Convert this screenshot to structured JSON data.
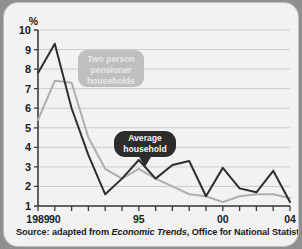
{
  "chart_data": {
    "type": "line",
    "title": "",
    "subtitle": "",
    "xlabel": "",
    "ylabel": "%",
    "ylim": [
      1,
      10
    ],
    "xlim": [
      1989,
      2004
    ],
    "grid": true,
    "legend_position": "inline-callouts",
    "y_ticks": [
      "10",
      "9",
      "8",
      "7",
      "6",
      "5",
      "4",
      "3",
      "2",
      "1"
    ],
    "x_tick_years": [
      1989,
      1990,
      1991,
      1992,
      1993,
      1994,
      1995,
      1996,
      1997,
      1998,
      1999,
      2000,
      2001,
      2002,
      2003,
      2004
    ],
    "x_tick_labels": [
      {
        "year": 1989,
        "label": "1989"
      },
      {
        "year": 1990,
        "label": "90"
      },
      {
        "year": 1995,
        "label": "95"
      },
      {
        "year": 2000,
        "label": "00"
      },
      {
        "year": 2004,
        "label": "04"
      }
    ],
    "x": [
      1989,
      1990,
      1991,
      1992,
      1993,
      1994,
      1995,
      1996,
      1997,
      1998,
      1999,
      2000,
      2001,
      2002,
      2003,
      2004
    ],
    "series": [
      {
        "name": "Two person pensioner households",
        "color": "#aeaeae",
        "values": [
          5.4,
          7.4,
          7.3,
          4.5,
          2.9,
          2.4,
          2.9,
          2.4,
          2.0,
          1.6,
          1.5,
          1.2,
          1.5,
          1.6,
          1.6,
          1.4
        ]
      },
      {
        "name": "Average household",
        "color": "#2e2e2e",
        "values": [
          7.8,
          9.3,
          6.0,
          3.6,
          1.6,
          2.4,
          3.35,
          2.4,
          3.1,
          3.3,
          1.5,
          2.95,
          1.9,
          1.7,
          2.8,
          1.2
        ]
      }
    ],
    "annotations": [
      {
        "id": "callout-two-person",
        "lines": [
          "Two person",
          "pensioner",
          "households"
        ],
        "style": "light",
        "target_series": "Two person pensioner households"
      },
      {
        "id": "callout-average",
        "lines": [
          "Average",
          "household"
        ],
        "style": "dark",
        "target_series": "Average household",
        "pointer": "down"
      }
    ]
  },
  "source": {
    "prefix": "Source: adapted from ",
    "italic": "Economic Trends",
    "suffix": ",  Office for  National Statistics."
  }
}
